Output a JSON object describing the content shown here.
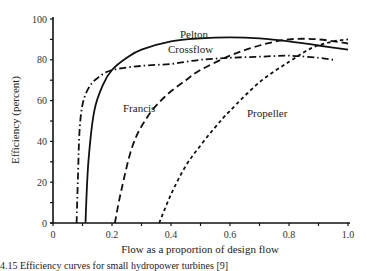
{
  "chart_data": {
    "type": "line",
    "title": "",
    "xlabel": "Flow as a proportion of design flow",
    "ylabel": "Efficiency (percent)",
    "xlim": [
      0,
      1.0
    ],
    "ylim": [
      0,
      100
    ],
    "xticks": [
      "0",
      "0.2",
      "0.4",
      "0.6",
      "0.8",
      "1.0"
    ],
    "yticks": [
      "0",
      "20",
      "40",
      "60",
      "80",
      "100"
    ],
    "grid": false,
    "legend": "inline labels",
    "series": [
      {
        "name": "Pelton",
        "style": "solid",
        "x": [
          0.11,
          0.12,
          0.14,
          0.17,
          0.2,
          0.25,
          0.3,
          0.4,
          0.5,
          0.6,
          0.7,
          0.8,
          0.9,
          1.0
        ],
        "y": [
          0,
          30,
          55,
          68,
          75,
          81,
          85,
          89,
          90.5,
          91,
          90.5,
          89,
          87,
          85
        ]
      },
      {
        "name": "Crossflow",
        "style": "dash-dot",
        "x": [
          0.08,
          0.085,
          0.09,
          0.1,
          0.12,
          0.15,
          0.2,
          0.3,
          0.4,
          0.5,
          0.6,
          0.7,
          0.8,
          0.9,
          0.95
        ],
        "y": [
          0,
          25,
          45,
          58,
          66,
          71,
          75,
          77,
          78,
          80,
          81,
          81.5,
          82,
          81,
          80
        ]
      },
      {
        "name": "Francis",
        "style": "long-dash",
        "x": [
          0.21,
          0.23,
          0.27,
          0.32,
          0.38,
          0.45,
          0.5,
          0.6,
          0.7,
          0.8,
          0.9,
          1.0
        ],
        "y": [
          0,
          15,
          38,
          52,
          62,
          70,
          75,
          82,
          87,
          90,
          90,
          88
        ]
      },
      {
        "name": "Propeller",
        "style": "short-dash",
        "x": [
          0.36,
          0.4,
          0.45,
          0.5,
          0.55,
          0.6,
          0.7,
          0.8,
          0.88,
          0.95,
          1.0
        ],
        "y": [
          0,
          14,
          28,
          38,
          47,
          55,
          69,
          79,
          86,
          89,
          90
        ]
      }
    ],
    "annotations": [
      "Pelton",
      "Crossflow",
      "Francis",
      "Propeller"
    ]
  },
  "labels": {
    "pelton": "Pelton",
    "crossflow": "Crossflow",
    "francis": "Francis",
    "propeller": "Propeller",
    "xlabel": "Flow as a proportion of design flow",
    "ylabel": "Efficiency (percent)",
    "caption": "4.15  Efficiency curves for small hydropower turbines [9]"
  }
}
